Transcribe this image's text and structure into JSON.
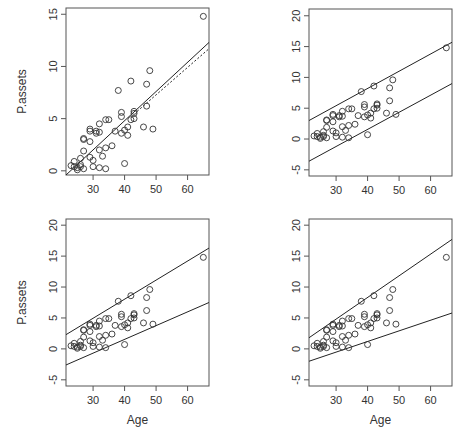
{
  "figure": {
    "width": 466,
    "height": 443,
    "colors": {
      "axis": "#555555",
      "point": "#333333",
      "line": "#222222",
      "text": "#333333"
    }
  },
  "chart_data": [
    {
      "type": "scatter",
      "panel": "top-left",
      "title": "",
      "xlabel": "",
      "ylabel": "P.assets",
      "xlim": [
        21.4,
        66.8
      ],
      "ylim": [
        -0.4,
        15.6
      ],
      "xticks": [
        30,
        40,
        50,
        60
      ],
      "yticks": [
        0,
        5,
        10,
        15
      ],
      "grid": false,
      "lines": [
        {
          "name": "fit-solid",
          "style": "solid",
          "x": [
            21.4,
            66.8
          ],
          "y": [
            -0.4,
            12.3
          ]
        },
        {
          "name": "fit-dotted",
          "style": "dotted",
          "x": [
            44,
            66.8
          ],
          "y": [
            5.7,
            11.7
          ]
        }
      ]
    },
    {
      "type": "scatter",
      "panel": "top-right",
      "title": "",
      "xlabel": "",
      "ylabel": "",
      "xlim": [
        21.4,
        66.8
      ],
      "ylim": [
        -6.0,
        21.1
      ],
      "xticks": [
        30,
        40,
        50,
        60
      ],
      "yticks": [
        -5,
        0,
        5,
        10,
        15,
        20
      ],
      "grid": false,
      "lines": [
        {
          "name": "upper-band",
          "style": "solid",
          "x": [
            21.4,
            66.8
          ],
          "y": [
            3.0,
            15.7
          ]
        },
        {
          "name": "lower-band",
          "style": "solid",
          "x": [
            21.4,
            66.8
          ],
          "y": [
            -3.6,
            9.0
          ]
        }
      ]
    },
    {
      "type": "scatter",
      "panel": "bottom-left",
      "title": "",
      "xlabel": "Age",
      "ylabel": "P.assets",
      "xlim": [
        21.4,
        66.8
      ],
      "ylim": [
        -6.0,
        21.0
      ],
      "xticks": [
        30,
        40,
        50,
        60
      ],
      "yticks": [
        -5,
        0,
        5,
        10,
        15,
        20
      ],
      "grid": false,
      "lines": [
        {
          "name": "upper-band",
          "style": "solid",
          "x": [
            21.4,
            66.8
          ],
          "y": [
            2.3,
            16.3
          ]
        },
        {
          "name": "lower-band",
          "style": "solid",
          "x": [
            21.4,
            66.8
          ],
          "y": [
            -2.6,
            7.5
          ]
        }
      ]
    },
    {
      "type": "scatter",
      "panel": "bottom-right",
      "title": "",
      "xlabel": "Age",
      "ylabel": "",
      "xlim": [
        21.4,
        66.8
      ],
      "ylim": [
        -6.0,
        21.0
      ],
      "xticks": [
        30,
        40,
        50,
        60
      ],
      "yticks": [
        -5,
        0,
        5,
        10,
        15,
        20
      ],
      "grid": false,
      "lines": [
        {
          "name": "upper-band",
          "style": "solid",
          "x": [
            21.4,
            66.8
          ],
          "y": [
            1.8,
            17.7
          ]
        },
        {
          "name": "lower-band",
          "style": "solid",
          "x": [
            21.4,
            66.8
          ],
          "y": [
            -2.0,
            5.8
          ]
        }
      ]
    }
  ],
  "points": {
    "x": [
      65,
      48,
      47,
      42,
      38,
      47,
      43,
      43,
      43,
      39,
      39,
      42,
      34,
      35,
      32,
      29,
      29,
      31,
      31,
      32,
      37,
      40,
      41,
      39,
      41,
      46,
      49,
      27,
      27,
      29,
      36,
      34,
      32,
      27,
      33,
      29,
      30,
      26,
      24,
      40,
      23,
      24,
      26,
      26,
      25,
      27,
      30,
      32,
      34,
      25
    ],
    "y": [
      14.8,
      9.6,
      8.3,
      8.6,
      7.7,
      6.2,
      5.7,
      5.5,
      5.0,
      5.6,
      5.2,
      4.9,
      4.9,
      4.9,
      4.5,
      4.0,
      3.8,
      3.8,
      3.6,
      3.7,
      3.8,
      3.9,
      4.2,
      3.6,
      3.4,
      4.2,
      4.0,
      3.1,
      3.0,
      2.8,
      2.4,
      2.2,
      2.0,
      1.9,
      1.4,
      1.3,
      1.0,
      1.2,
      0.9,
      0.7,
      0.5,
      0.4,
      0.6,
      0.4,
      0.3,
      0.2,
      0.4,
      0.3,
      0.2,
      0.1
    ]
  },
  "panels": [
    {
      "id": "top-left",
      "box": [
        66,
        8,
        209,
        175
      ],
      "ylabel_x": 26,
      "xlabel_y": 0
    },
    {
      "id": "top-right",
      "box": [
        309,
        9,
        452,
        176
      ],
      "ylabel_x": 0,
      "xlabel_y": 0
    },
    {
      "id": "bottom-left",
      "box": [
        66,
        219,
        209,
        386
      ],
      "ylabel_x": 26,
      "xlabel_y": 424
    },
    {
      "id": "bottom-right",
      "box": [
        309,
        219,
        452,
        386
      ],
      "ylabel_x": 0,
      "xlabel_y": 424
    }
  ]
}
